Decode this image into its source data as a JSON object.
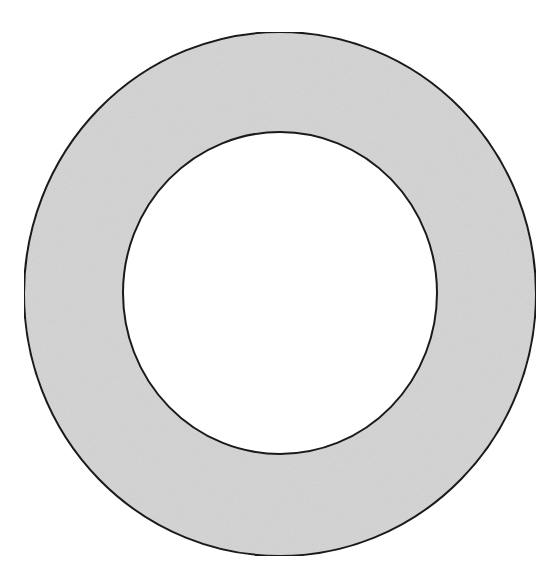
{
  "diagram": {
    "shape": "annulus",
    "background_color": "#ffffff",
    "ring_fill_color": "#d6d6d6",
    "inner_fill_color": "#ffffff",
    "stroke_color": "#1a1a1a",
    "stroke_width": 2,
    "outer_circle": {
      "cx": 280,
      "cy": 294,
      "rx": 256,
      "ry": 262
    },
    "inner_circle": {
      "cx": 280,
      "cy": 293,
      "rx": 157,
      "ry": 161
    }
  }
}
